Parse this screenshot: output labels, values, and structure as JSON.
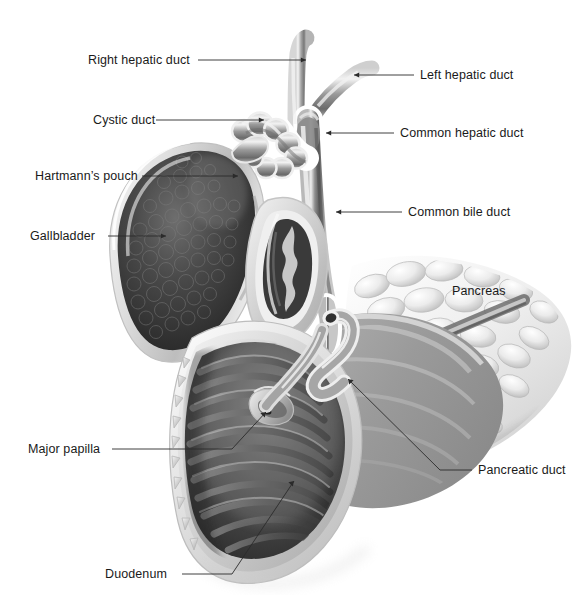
{
  "figure": {
    "background_color": "#ffffff",
    "label_color": "#1a1a1a",
    "leader_color": "#2b2b2b",
    "width": 584,
    "height": 612
  },
  "labels": [
    {
      "id": "right-hepatic-duct",
      "text": "Right hepatic duct",
      "text_x": 88,
      "text_y": 65,
      "align": "left",
      "leader": "M198,60 L306,60",
      "arrow": "end",
      "arrow_x": 306,
      "arrow_y": 60,
      "arrow_dir": "right"
    },
    {
      "id": "cystic-duct",
      "text": "Cystic duct",
      "text_x": 93,
      "text_y": 125,
      "align": "left",
      "leader": "M156,120 L264,120",
      "arrow": "end",
      "arrow_x": 264,
      "arrow_y": 120,
      "arrow_dir": "right"
    },
    {
      "id": "hartmanns-pouch",
      "text": "Hartmann’s pouch",
      "text_x": 35,
      "text_y": 181,
      "align": "left",
      "leader": "M142,176 L238,176",
      "arrow": "end",
      "arrow_x": 238,
      "arrow_y": 176,
      "arrow_dir": "right"
    },
    {
      "id": "gallbladder",
      "text": "Gallbladder",
      "text_x": 30,
      "text_y": 241,
      "align": "left",
      "leader": "M108,236 L166,236",
      "arrow": "end",
      "arrow_x": 166,
      "arrow_y": 236,
      "arrow_dir": "right"
    },
    {
      "id": "major-papilla",
      "text": "Major papilla",
      "text_x": 28,
      "text_y": 454,
      "align": "left",
      "leader": "M112,449 L232,449 L266,412",
      "arrow": "end",
      "arrow_x": 266,
      "arrow_y": 412,
      "arrow_dir": "upright"
    },
    {
      "id": "duodenum",
      "text": "Duodenum",
      "text_x": 105,
      "text_y": 579,
      "align": "left",
      "leader": "M182,574 L232,574 L294,481",
      "arrow": "end",
      "arrow_x": 294,
      "arrow_y": 481,
      "arrow_dir": "upright"
    },
    {
      "id": "left-hepatic-duct",
      "text": "Left hepatic duct",
      "text_x": 420,
      "text_y": 80,
      "align": "left",
      "leader": "M414,75 L354,75",
      "arrow": "end",
      "arrow_x": 354,
      "arrow_y": 75,
      "arrow_dir": "left"
    },
    {
      "id": "common-hepatic-duct",
      "text": "Common hepatic duct",
      "text_x": 400,
      "text_y": 138,
      "align": "left",
      "leader": "M394,133 L326,133",
      "arrow": "end",
      "arrow_x": 326,
      "arrow_y": 133,
      "arrow_dir": "left"
    },
    {
      "id": "common-bile-duct",
      "text": "Common bile duct",
      "text_x": 408,
      "text_y": 217,
      "align": "left",
      "leader": "M402,212 L336,212",
      "arrow": "end",
      "arrow_x": 336,
      "arrow_y": 212,
      "arrow_dir": "left"
    },
    {
      "id": "pancreas",
      "text": "Pancreas",
      "text_x": 452,
      "text_y": 296,
      "align": "left",
      "leader": "",
      "arrow": "none"
    },
    {
      "id": "pancreatic-duct",
      "text": "Pancreatic duct",
      "text_x": 478,
      "text_y": 475,
      "align": "left",
      "leader": "M472,470 L440,470 L348,379",
      "arrow": "end",
      "arrow_x": 348,
      "arrow_y": 379,
      "arrow_dir": "upleft"
    }
  ],
  "structures": [
    {
      "id": "gallbladder-body",
      "name": "Gallbladder",
      "fill": "#3b3b3b",
      "wall": "#d9d9d9"
    },
    {
      "id": "hartmanns-pouch-region",
      "name": "Hartmann's pouch",
      "fill": "#4a4a4a"
    },
    {
      "id": "cystic-duct-spiral",
      "name": "Cystic duct",
      "fill": "#9c9c9c"
    },
    {
      "id": "right-hepatic-duct-branch",
      "name": "Right hepatic duct",
      "fill": "#8a8a8a"
    },
    {
      "id": "left-hepatic-duct-branch",
      "name": "Left hepatic duct",
      "fill": "#8a8a8a"
    },
    {
      "id": "common-hepatic-duct-trunk",
      "name": "Common hepatic duct",
      "fill": "#7d7d7d"
    },
    {
      "id": "common-bile-duct-trunk",
      "name": "Common bile duct",
      "fill": "#757575"
    },
    {
      "id": "duodenum-lumen",
      "name": "Duodenum",
      "fill": "#4f4f4f",
      "wall": "#cfcfcf"
    },
    {
      "id": "pancreas-lobules",
      "name": "Pancreas",
      "fill": "#e3e3e3"
    },
    {
      "id": "pancreatic-duct-tube",
      "name": "Pancreatic duct",
      "fill": "#8e8e8e"
    },
    {
      "id": "major-papilla-orifice",
      "name": "Major papilla",
      "fill": "#a8a8a8"
    }
  ]
}
